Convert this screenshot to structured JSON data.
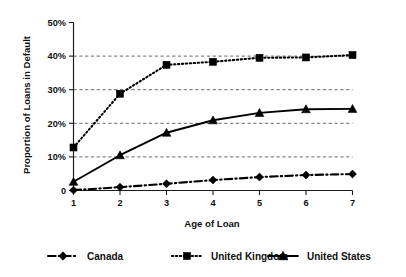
{
  "chart_data": {
    "type": "line",
    "title": "",
    "xlabel": "Age of Loan",
    "ylabel": "Proportion of Loans in Default",
    "x": [
      1,
      2,
      3,
      4,
      5,
      6,
      7
    ],
    "xtick_labels": [
      "1",
      "2",
      "3",
      "4",
      "5",
      "6",
      "7"
    ],
    "ytick_labels": [
      "0",
      "10%",
      "20%",
      "30%",
      "40%",
      "50%"
    ],
    "ytick_values": [
      0,
      10,
      20,
      30,
      40,
      50
    ],
    "xlim": [
      1,
      7
    ],
    "ylim": [
      0,
      50
    ],
    "grid": "horizontal-dashed",
    "legend_position": "bottom",
    "series": [
      {
        "name": "Canada",
        "marker": "diamond",
        "linestyle": "dash-dot",
        "color": "#000000",
        "values": [
          0.1,
          1.0,
          2.0,
          3.1,
          4.0,
          4.6,
          4.9
        ]
      },
      {
        "name": "United Kingdom",
        "marker": "square",
        "linestyle": "dotted",
        "color": "#000000",
        "values": [
          12.8,
          28.8,
          37.4,
          38.3,
          39.5,
          39.6,
          40.3
        ]
      },
      {
        "name": "United States",
        "marker": "triangle",
        "linestyle": "solid",
        "color": "#000000",
        "values": [
          2.6,
          10.5,
          17.2,
          20.9,
          23.1,
          24.2,
          24.3
        ]
      }
    ]
  },
  "axes": {
    "y_title": "Proportion of Loans in Default",
    "x_title": "Age of Loan",
    "y_ticks": [
      "50%",
      "40%",
      "30%",
      "20%",
      "10%",
      "0"
    ],
    "x_ticks": [
      "1",
      "2",
      "3",
      "4",
      "5",
      "6",
      "7"
    ]
  },
  "legend": {
    "items": [
      {
        "label": "Canada",
        "marker": "diamond-marker",
        "style": "dash-dot"
      },
      {
        "label": "United Kingdom",
        "marker": "square-marker",
        "style": "dotted"
      },
      {
        "label": "United States",
        "marker": "triangle-marker",
        "style": "solid"
      }
    ]
  }
}
